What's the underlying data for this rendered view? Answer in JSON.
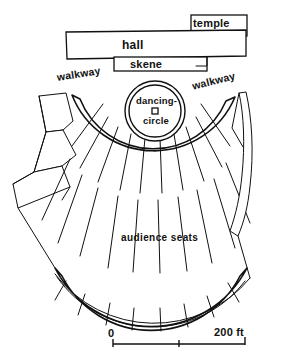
{
  "figure": {
    "type": "architectural-plan",
    "background_color": "#ffffff",
    "ink_color": "#111111"
  },
  "labels": {
    "temple": "temple",
    "hall": "hall",
    "skene": "skene",
    "walkway_left": "walkway",
    "walkway_right": "walkway",
    "dancing": "dancing-",
    "circle": "circle",
    "audience": "audience  seats"
  },
  "scale": {
    "start_label": "0",
    "end_label": "200 ft",
    "tick_count": 3,
    "unit": "ft",
    "start_value": 0,
    "end_value": 200,
    "mid_value": 100
  },
  "structures": [
    {
      "name": "temple",
      "shape": "rectangle"
    },
    {
      "name": "hall",
      "shape": "rectangle"
    },
    {
      "name": "skene",
      "shape": "rectangle"
    },
    {
      "name": "dancing-circle",
      "shape": "circle"
    },
    {
      "name": "altar",
      "shape": "small-square"
    },
    {
      "name": "audience-seats",
      "shape": "fan-of-wedges"
    },
    {
      "name": "walkway-left",
      "shape": "arc-band"
    },
    {
      "name": "walkway-right",
      "shape": "arc-band"
    },
    {
      "name": "diazoma-upper",
      "shape": "arc-band"
    },
    {
      "name": "diazoma-lower",
      "shape": "arc-band"
    },
    {
      "name": "left-annex",
      "shape": "polygon"
    },
    {
      "name": "right-wing",
      "shape": "curved-sliver"
    }
  ]
}
